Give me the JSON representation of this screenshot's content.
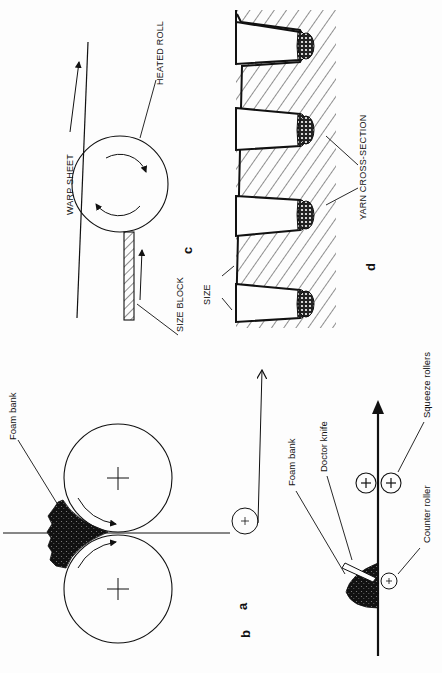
{
  "figure": {
    "orientation": "rotated-90-ccw",
    "panels": {
      "a": {
        "letter": "a",
        "labels": {
          "foam_bank": "Foam bank"
        },
        "description": "Two large rollers with foam bank at the nip; fabric passes through nip and over a small guide roller"
      },
      "b": {
        "letter": "b",
        "labels": {
          "foam_bank": "Foam bank",
          "doctor_knife": "Doctor knife",
          "counter_roller": "Counter roller",
          "squeeze_rollers": "Squeeze rollers"
        },
        "description": "Knife-over-roller foam application followed by squeeze rollers"
      },
      "c": {
        "letter": "c",
        "labels": {
          "warp_sheet": "WARP SHEET",
          "heated_roll": "HEATED ROLL",
          "size_block": "SIZE BLOCK"
        },
        "description": "Size block pressed against heated roll contacting warp sheet"
      },
      "d": {
        "letter": "d",
        "labels": {
          "size": "SIZE",
          "yarn_cross_section": "YARN CROSS-SECTION"
        },
        "description": "Cross-section of sized yarns in grooves"
      }
    },
    "colors": {
      "ink": "#111111",
      "background": "#fdfdfd"
    }
  }
}
